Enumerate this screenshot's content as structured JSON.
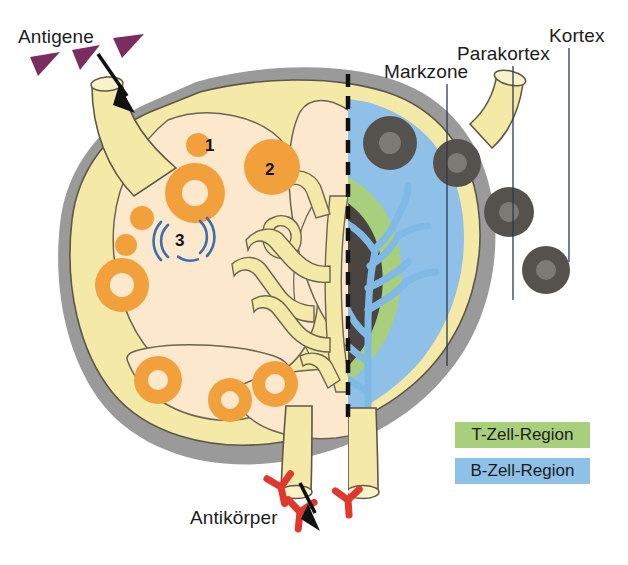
{
  "figure": {
    "title_alt": "Lymphknoten Aufbau",
    "language": "de"
  },
  "labels": {
    "antigene": "Antigene",
    "markzone": "Markzone",
    "parakortex": "Parakortex",
    "kortex": "Kortex",
    "antikoerper": "Antikörper"
  },
  "markers": {
    "one": "1",
    "two": "2",
    "three": "3"
  },
  "legend": {
    "items": [
      {
        "label": "T-Zell-Region",
        "color": "#a8cf7c"
      },
      {
        "label": "B-Zell-Region",
        "color": "#8fc0e8"
      }
    ]
  },
  "colors": {
    "capsule_gray": "#9a9a9a",
    "sinus_yellow": "#f5e9a8",
    "cortex_cream": "#fbe8cd",
    "follicle_orange": "#f2a03c",
    "t_zone_green": "#a8cf7c",
    "b_zone_blue": "#8fc0e8",
    "medulla_dark": "#4a4540",
    "lymphocyte_gray": "#55524e",
    "antigen_purple": "#7b2d62",
    "antibody_red": "#e0382c",
    "arrow_black": "#111111",
    "outline": "#6a6450",
    "leader_line": "#2b3a52"
  }
}
